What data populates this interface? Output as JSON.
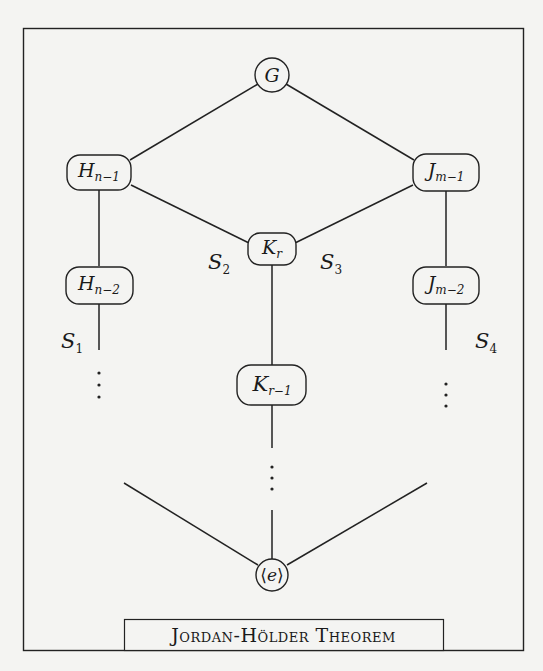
{
  "diagram": {
    "title": "Jordan-Hölder Theorem",
    "colors": {
      "background": "#f4f4f2",
      "stroke": "#222222",
      "text": "#1a1a1a"
    },
    "nodes": [
      {
        "id": "G",
        "label": "G",
        "sub": "",
        "shape": "circle"
      },
      {
        "id": "H_n-1",
        "label": "H",
        "sub": "n−1",
        "shape": "rounded-rect"
      },
      {
        "id": "H_n-2",
        "label": "H",
        "sub": "n−2",
        "shape": "rounded-rect"
      },
      {
        "id": "J_m-1",
        "label": "J",
        "sub": "m−1",
        "shape": "rounded-rect"
      },
      {
        "id": "J_m-2",
        "label": "J",
        "sub": "m−2",
        "shape": "rounded-rect"
      },
      {
        "id": "K_r",
        "label": "K",
        "sub": "r",
        "shape": "rounded-rect"
      },
      {
        "id": "K_r-1",
        "label": "K",
        "sub": "r−1",
        "shape": "rounded-rect"
      },
      {
        "id": "e",
        "label_open": "⟨",
        "label": "e",
        "label_close": "⟩",
        "shape": "circle"
      }
    ],
    "edges": [
      [
        "G",
        "H_n-1"
      ],
      [
        "G",
        "J_m-1"
      ],
      [
        "H_n-1",
        "K_r"
      ],
      [
        "J_m-1",
        "K_r"
      ],
      [
        "H_n-1",
        "H_n-2"
      ],
      [
        "J_m-1",
        "J_m-2"
      ],
      [
        "K_r",
        "K_r-1"
      ]
    ],
    "series_labels": [
      {
        "id": "S1",
        "letter": "S",
        "sub": "1"
      },
      {
        "id": "S2",
        "letter": "S",
        "sub": "2"
      },
      {
        "id": "S3",
        "letter": "S",
        "sub": "3"
      },
      {
        "id": "S4",
        "letter": "S",
        "sub": "4"
      }
    ],
    "ellipsis": "⋮",
    "caption": "Jordan-Hölder Theorem"
  }
}
